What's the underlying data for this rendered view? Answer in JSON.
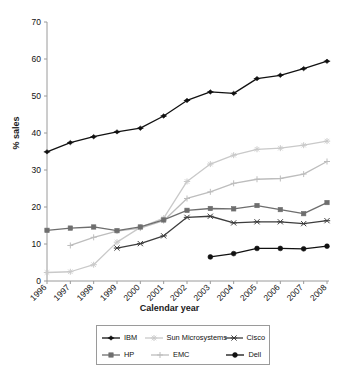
{
  "chart_data": {
    "type": "line",
    "title": "",
    "xlabel": "Calendar year",
    "ylabel": "% sales",
    "categories": [
      "1996",
      "1997",
      "1998",
      "1999",
      "2000",
      "2001",
      "2002",
      "2003",
      "2004",
      "2005",
      "2006",
      "2007",
      "2008"
    ],
    "x": [
      1996,
      1997,
      1998,
      1999,
      2000,
      2001,
      2002,
      2003,
      2004,
      2005,
      2006,
      2007,
      2008
    ],
    "xlim": [
      1996,
      2008
    ],
    "ylim": [
      0,
      70
    ],
    "yticks": [
      0,
      10,
      20,
      30,
      40,
      50,
      60,
      70
    ],
    "grid": false,
    "legend_position": "bottom",
    "series": [
      {
        "name": "IBM",
        "color": "#111111",
        "marker": "diamond",
        "values": [
          34.9,
          37.4,
          39.0,
          40.3,
          41.3,
          44.6,
          48.8,
          51.1,
          50.7,
          54.7,
          55.6,
          57.4,
          59.4
        ]
      },
      {
        "name": "HP",
        "color": "#6e6e6e",
        "marker": "square",
        "values": [
          13.7,
          14.3,
          14.6,
          13.6,
          14.6,
          16.5,
          19.1,
          19.6,
          19.5,
          20.4,
          19.3,
          18.2,
          21.2
        ]
      },
      {
        "name": "Sun Microsystems",
        "color": "#c9c9c9",
        "marker": "star",
        "values": [
          2.3,
          2.5,
          4.4,
          10.5,
          14.5,
          17.0,
          26.9,
          31.6,
          34.0,
          35.6,
          35.9,
          36.7,
          37.8
        ]
      },
      {
        "name": "EMC",
        "color": "#bdbdbd",
        "marker": "plus",
        "values": [
          null,
          9.6,
          11.8,
          13.5,
          14.3,
          16.3,
          22.3,
          24.1,
          26.4,
          27.5,
          27.7,
          28.9,
          32.3
        ]
      },
      {
        "name": "Cisco",
        "color": "#3d3d3d",
        "marker": "cross",
        "values": [
          null,
          null,
          null,
          8.9,
          10.1,
          12.2,
          17.2,
          17.5,
          15.7,
          16.0,
          16.0,
          15.5,
          16.3
        ]
      },
      {
        "name": "Dell",
        "color": "#111111",
        "marker": "circle",
        "values": [
          null,
          null,
          null,
          null,
          null,
          null,
          null,
          6.5,
          7.4,
          8.8,
          8.8,
          8.7,
          9.4
        ]
      }
    ]
  },
  "legend": {
    "rows": [
      [
        {
          "name": "IBM",
          "series": 0
        },
        {
          "name": "Sun Microsystems",
          "series": 2
        },
        {
          "name": "Cisco",
          "series": 4
        }
      ],
      [
        {
          "name": "HP",
          "series": 1
        },
        {
          "name": "EMC",
          "series": 3
        },
        {
          "name": "Dell",
          "series": 5
        }
      ]
    ]
  }
}
